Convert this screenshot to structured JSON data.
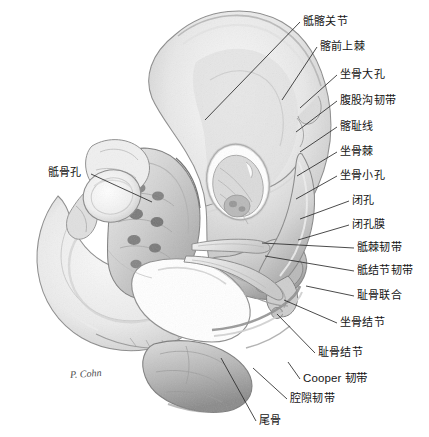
{
  "figure": {
    "view": "anterior-superior oblique",
    "background_color": "#ffffff",
    "ink_color": "#141414",
    "leader_color": "#2b2b2b",
    "bone_light": "#f2f2f2",
    "bone_mid": "#cfcfcf",
    "bone_dark": "#9a9a9a",
    "bone_shadow": "#6e6e6e",
    "signature": "P. Cohn"
  },
  "labels": [
    {
      "id": "sacroiliac-joint",
      "text": "骶髂关节",
      "x": 303,
      "y": 15,
      "anchor": "left"
    },
    {
      "id": "anterior-superior-iliac-spine",
      "text": "髂前上棘",
      "x": 320,
      "y": 40,
      "anchor": "left"
    },
    {
      "id": "greater-sciatic-foramen",
      "text": "坐骨大孔",
      "x": 340,
      "y": 68,
      "anchor": "left"
    },
    {
      "id": "inguinal-ligament",
      "text": "腹股沟韧带",
      "x": 340,
      "y": 94,
      "anchor": "left"
    },
    {
      "id": "iliopectineal-line",
      "text": "髂耻线",
      "x": 340,
      "y": 120,
      "anchor": "left"
    },
    {
      "id": "ischial-spine",
      "text": "坐骨棘",
      "x": 340,
      "y": 145,
      "anchor": "left"
    },
    {
      "id": "lesser-sciatic-foramen",
      "text": "坐骨小孔",
      "x": 340,
      "y": 169,
      "anchor": "left"
    },
    {
      "id": "obturator-foramen",
      "text": "闭孔",
      "x": 352,
      "y": 194,
      "anchor": "left"
    },
    {
      "id": "obturator-membrane",
      "text": "闭孔膜",
      "x": 352,
      "y": 218,
      "anchor": "left"
    },
    {
      "id": "sacrospinous-ligament",
      "text": "骶棘韧带",
      "x": 357,
      "y": 241,
      "anchor": "left"
    },
    {
      "id": "sacrotuberous-ligament",
      "text": "骶结节韧带",
      "x": 357,
      "y": 264,
      "anchor": "left"
    },
    {
      "id": "pubic-symphysis",
      "text": "耻骨联合",
      "x": 357,
      "y": 289,
      "anchor": "left"
    },
    {
      "id": "ischial-tuberosity",
      "text": "坐骨结节",
      "x": 340,
      "y": 316,
      "anchor": "left"
    },
    {
      "id": "pubic-tubercle",
      "text": "耻骨结节",
      "x": 318,
      "y": 346,
      "anchor": "left"
    },
    {
      "id": "cooper-ligament",
      "text": "Cooper 韧带",
      "x": 303,
      "y": 372,
      "anchor": "left",
      "latin": true
    },
    {
      "id": "lacunar-ligament",
      "text": "腔隙韧带",
      "x": 290,
      "y": 392,
      "anchor": "left"
    },
    {
      "id": "coccyx",
      "text": "尾骨",
      "x": 259,
      "y": 414,
      "anchor": "left"
    },
    {
      "id": "sacral-foramina",
      "text": "骶骨孔",
      "x": 48,
      "y": 166,
      "anchor": "right"
    }
  ],
  "leaders": [
    {
      "id": "leader-sacroiliac-joint",
      "points": "300,22 205,120"
    },
    {
      "id": "leader-asis",
      "points": "317,47 282,100"
    },
    {
      "id": "leader-greater-sciatic-foramen",
      "points": "337,75 300,108"
    },
    {
      "id": "leader-inguinal-ligament",
      "points": "337,101 296,132"
    },
    {
      "id": "leader-iliopectineal-line",
      "points": "337,127 300,152"
    },
    {
      "id": "leader-ischial-spine",
      "points": "337,152 297,176"
    },
    {
      "id": "leader-lesser-sciatic-foramen",
      "points": "337,176 296,199"
    },
    {
      "id": "leader-obturator-foramen",
      "points": "349,201 300,219"
    },
    {
      "id": "leader-obturator-membrane",
      "points": "349,225 298,240"
    },
    {
      "id": "leader-sacrospinous-ligament",
      "points": "354,248 262,243"
    },
    {
      "id": "leader-sacrotuberous-ligament",
      "points": "354,271 265,256"
    },
    {
      "id": "leader-pubic-symphysis",
      "points": "354,296 306,286"
    },
    {
      "id": "leader-ischial-tuberosity",
      "points": "337,323 284,300"
    },
    {
      "id": "leader-pubic-tubercle",
      "points": "315,353 277,314"
    },
    {
      "id": "leader-cooper-ligament",
      "points": "300,379 288,362"
    },
    {
      "id": "leader-lacunar-ligament",
      "points": "287,399 253,368"
    },
    {
      "id": "leader-coccyx",
      "points": "256,421 221,358"
    },
    {
      "id": "leader-sacral-foramina",
      "points": "91,174 152,202"
    }
  ],
  "signature": {
    "text": "P. Cohn",
    "x": 70,
    "y": 368
  }
}
